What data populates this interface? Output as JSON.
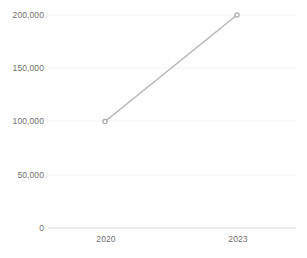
{
  "chart_data": {
    "type": "line",
    "title": "",
    "subtitle": "",
    "xlabel": "",
    "ylabel": "",
    "categories": [
      "2020",
      "2023"
    ],
    "x": [
      2020,
      2023
    ],
    "values": [
      100000,
      200000
    ],
    "series": [
      {
        "name": "",
        "values": [
          100000,
          200000
        ]
      }
    ],
    "ylim": [
      0,
      200000
    ],
    "y_ticks": [
      0,
      50000,
      100000,
      150000,
      200000
    ],
    "y_tick_labels": [
      "0",
      "50,000",
      "100,000",
      "150,000",
      "200,000"
    ],
    "x_tick_labels": [
      "2020",
      "2023"
    ],
    "grid": true,
    "grid_axis": "y",
    "legend": false,
    "legend_position": "none",
    "markers": true,
    "annotations": []
  },
  "style": {
    "background": "#ffffff",
    "line_color": "#b3b3b3",
    "marker_color": "#a8a8a8",
    "gridline_color": "#f2f2f2",
    "baseline_color": "#d9d9d9",
    "tick_label_color": "#6f6f6f"
  },
  "geometry": {
    "plot_left": 48,
    "plot_right": 296,
    "plot_top": 15,
    "plot_bottom": 228,
    "tick_x_positions": [
      105,
      237
    ],
    "tick_y_positions": [
      228,
      175,
      121,
      68,
      15
    ]
  }
}
